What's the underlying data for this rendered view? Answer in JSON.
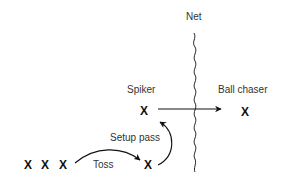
{
  "diagram": {
    "net": {
      "label": "Net"
    },
    "spiker": {
      "label": "Spiker",
      "marker": "X"
    },
    "ball_chaser": {
      "label": "Ball chaser",
      "marker": "X"
    },
    "setup_pass": {
      "label": "Setup pass"
    },
    "toss": {
      "label": "Toss"
    },
    "tossers": [
      {
        "marker": "X"
      },
      {
        "marker": "X"
      },
      {
        "marker": "X"
      }
    ],
    "setter": {
      "marker": "X"
    },
    "colors": {
      "ink": "#111111",
      "label": "#333333",
      "background": "#ffffff"
    }
  }
}
